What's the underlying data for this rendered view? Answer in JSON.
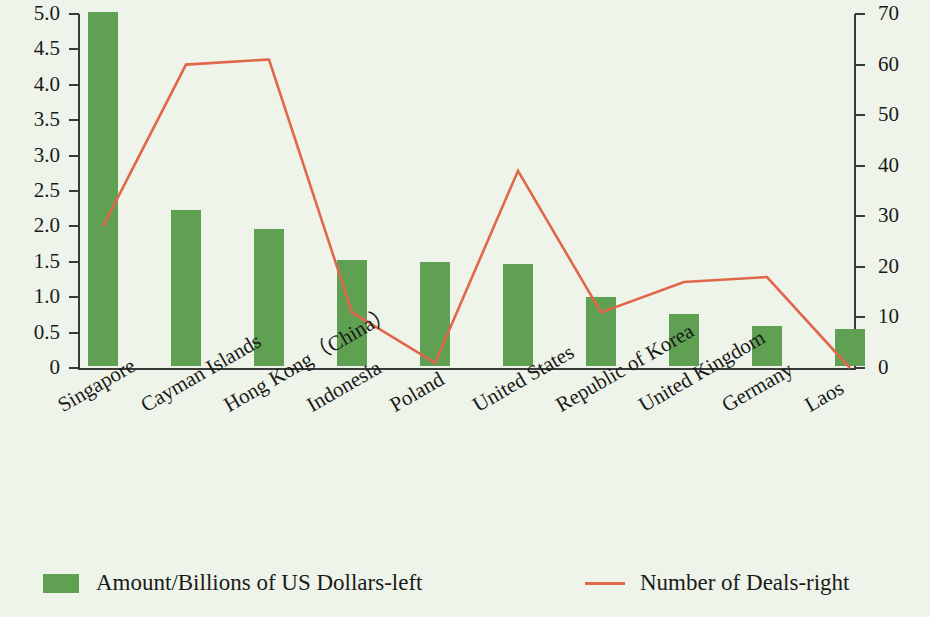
{
  "chart_data": {
    "type": "bar",
    "title": "",
    "subtitle": "",
    "xlabel": "",
    "ylabel": "",
    "categories": [
      "Singapore",
      "Cayman Islands",
      "Hong Kong（China）",
      "Indonesia",
      "Poland",
      "United States",
      "Republic of Korea",
      "United Kingdom",
      "Germany",
      "Laos"
    ],
    "series": [
      {
        "name": "Amount/Billions of US Dollars-left",
        "type": "bar",
        "axis": "left",
        "color": "#5fa052",
        "values": [
          5.0,
          2.2,
          1.93,
          1.5,
          1.47,
          1.44,
          0.97,
          0.73,
          0.57,
          0.52
        ]
      },
      {
        "name": "Number of Deals-right",
        "type": "line",
        "axis": "right",
        "color": "#e0674a",
        "values": [
          28,
          60,
          61,
          11,
          1,
          39,
          11,
          17,
          18,
          0
        ]
      }
    ],
    "left_axis": {
      "min": 0,
      "max": 5.0,
      "ticks": [
        0,
        0.5,
        1.0,
        1.5,
        2.0,
        2.5,
        3.0,
        3.5,
        4.0,
        4.5,
        5.0
      ],
      "tick_labels": [
        "0",
        "0.5",
        "1.0",
        "1.5",
        "2.0",
        "2.5",
        "3.0",
        "3.5",
        "4.0",
        "4.5",
        "5.0"
      ]
    },
    "right_axis": {
      "min": 0,
      "max": 70,
      "ticks": [
        0,
        10,
        20,
        30,
        40,
        50,
        60,
        70
      ],
      "tick_labels": [
        "0",
        "10",
        "20",
        "30",
        "40",
        "50",
        "60",
        "70"
      ]
    },
    "grid": false,
    "legend_position": "bottom"
  },
  "legend": {
    "bar_label": "Amount/Billions of US Dollars-left",
    "line_label": "Number of Deals-right"
  },
  "colors": {
    "background": "#eef4e9",
    "bar": "#5fa052",
    "line": "#e0674a",
    "axis": "#3a3a3a",
    "text": "#1a1a1a"
  }
}
